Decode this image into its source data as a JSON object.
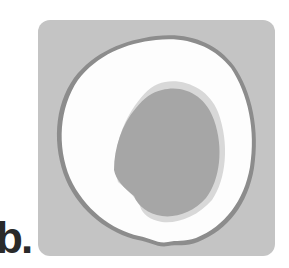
{
  "figure": {
    "panel_label": "b.",
    "colors": {
      "background": "#c4c4c4",
      "skin": "#8c8c8c",
      "flesh": "#fdfdfd",
      "pit": "#a6a6a6",
      "label": "#2a2a2a"
    }
  }
}
